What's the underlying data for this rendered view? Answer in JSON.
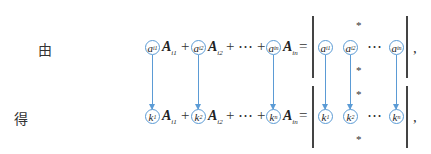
{
  "labels": {
    "given": "由",
    "obtain": "得"
  },
  "top_row": {
    "terms": [
      {
        "coef": "a",
        "coef_sub": "i1",
        "cofactor": "A",
        "cofactor_sub": "i1"
      },
      {
        "coef": "a",
        "coef_sub": "i2",
        "cofactor": "A",
        "cofactor_sub": "i2"
      },
      {
        "coef": "a",
        "coef_sub": "in",
        "cofactor": "A",
        "cofactor_sub": "in"
      }
    ],
    "plus": "+",
    "dots": "⋯",
    "equals": "=",
    "det_row": [
      {
        "sym": "a",
        "sub": "i1"
      },
      {
        "sym": "a",
        "sub": "i2"
      },
      {
        "sym": "a",
        "sub": "in"
      }
    ],
    "det_dots": "⋯",
    "star": "*",
    "trailing": ","
  },
  "bottom_row": {
    "terms": [
      {
        "coef": "k",
        "coef_sub": "1",
        "cofactor": "A",
        "cofactor_sub": "i1"
      },
      {
        "coef": "k",
        "coef_sub": "2",
        "cofactor": "A",
        "cofactor_sub": "i2"
      },
      {
        "coef": "k",
        "coef_sub": "n",
        "cofactor": "A",
        "cofactor_sub": "in"
      }
    ],
    "plus": "+",
    "dots": "⋯",
    "equals": "=",
    "det_row": [
      {
        "sym": "k",
        "sub": "1"
      },
      {
        "sym": "k",
        "sub": "2"
      },
      {
        "sym": "k",
        "sub": "n"
      }
    ],
    "det_dots": "⋯",
    "star": "*",
    "trailing": ","
  },
  "colors": {
    "highlight": "#5b9bd5",
    "text": "#222222"
  }
}
